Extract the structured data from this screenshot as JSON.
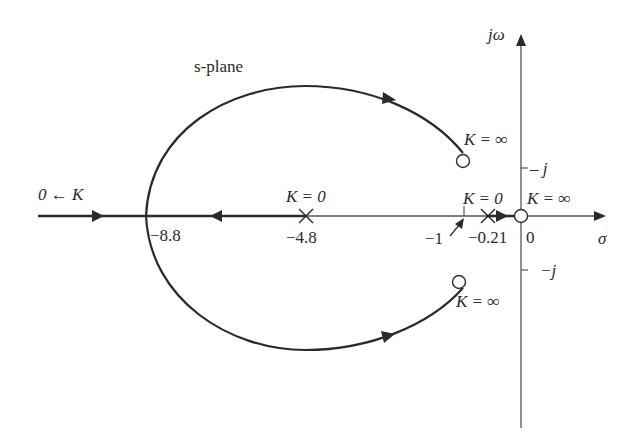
{
  "diagram": {
    "type": "root-locus",
    "title": "s-plane",
    "axes": {
      "real_label": "σ",
      "imag_label": "jω",
      "origin_label": "0",
      "pos_j_label": "j",
      "neg_j_label": "−j"
    },
    "left_branch_label": "0 ← K",
    "points": {
      "breakin": {
        "label": "−8.8"
      },
      "pole_a": {
        "label": "−4.8",
        "k_label": "K = 0"
      },
      "pole_b": {
        "label": "−0.21",
        "k_label": "K = 0"
      },
      "tick_minus_one": {
        "label": "−1"
      },
      "zero_origin": {
        "k_label": "K = ∞"
      },
      "zero_upper": {
        "k_label": "K = ∞"
      },
      "zero_lower": {
        "k_label": "K = ∞"
      }
    },
    "colors": {
      "stroke": "#2a2a2a",
      "axis": "#555555",
      "background": "#ffffff"
    }
  }
}
